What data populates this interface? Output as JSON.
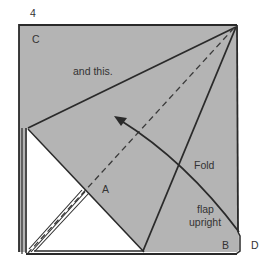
{
  "step_number": "4",
  "labels": {
    "corner_c": "C",
    "instruction_top": "and this.",
    "point_a": "A",
    "fold_text": "Fold",
    "flap_text_1": "flap",
    "flap_text_2": "upright",
    "corner_b": "B",
    "corner_d": "D"
  },
  "colors": {
    "paper_shaded": "#b4b4b4",
    "paper_white": "#ffffff",
    "line": "#2a2a2a"
  }
}
